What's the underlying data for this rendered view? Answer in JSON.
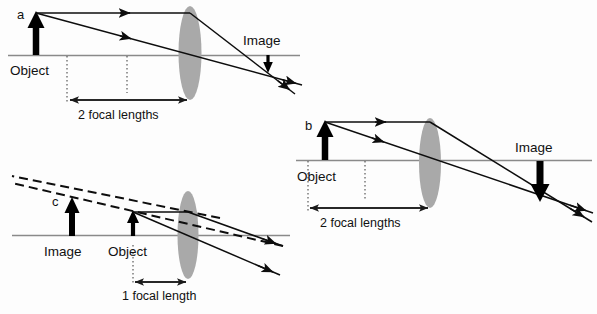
{
  "figure": {
    "background_color": "#fdfdfd",
    "lens_color": "#a9a9a9",
    "ray_color": "#0d0d0d",
    "axis_color": "#8a8a8a"
  },
  "diagrams": [
    {
      "id": "a",
      "letter_label": "a",
      "object_label": "Object",
      "image_label": "Image",
      "distance_label": "2 focal lengths",
      "object_distance": "2 focal lengths",
      "image_orientation": "inverted",
      "image_type": "real",
      "image_size": "smaller",
      "description": "Object beyond 2 focal lengths forms a small inverted real image"
    },
    {
      "id": "b",
      "letter_label": "b",
      "object_label": "Object",
      "image_label": "Image",
      "distance_label": "2 focal lengths",
      "object_distance": "2 focal lengths",
      "image_orientation": "inverted",
      "image_type": "real",
      "image_size": "larger",
      "description": "Object between 1 and 2 focal lengths forms a large inverted real image"
    },
    {
      "id": "c",
      "letter_label": "c",
      "object_label": "Object",
      "image_label": "Image",
      "distance_label": "1 focal  length",
      "object_distance": "1 focal length",
      "image_orientation": "upright",
      "image_type": "virtual",
      "image_size": "larger",
      "description": "Object inside 1 focal length forms an enlarged upright virtual image"
    }
  ]
}
